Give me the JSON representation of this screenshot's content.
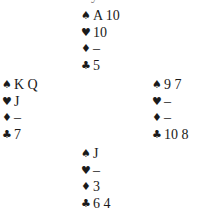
{
  "top_cut_text": "y",
  "hands": {
    "north": {
      "spades": "A 10",
      "hearts": "10",
      "diamonds": "–",
      "clubs": "5"
    },
    "west": {
      "spades": "K Q",
      "hearts": "J",
      "diamonds": "–",
      "clubs": "7"
    },
    "east": {
      "spades": "9 7",
      "hearts": "–",
      "diamonds": "–",
      "clubs": "10 8"
    },
    "south": {
      "spades": "J",
      "hearts": "–",
      "diamonds": "3",
      "clubs": "6 4"
    }
  },
  "suit_icons": {
    "spades": "♠",
    "hearts": "♥",
    "diamonds": "♦",
    "clubs": "♣"
  },
  "colors": {
    "text": "#1a1a1a",
    "background": "#ffffff"
  }
}
